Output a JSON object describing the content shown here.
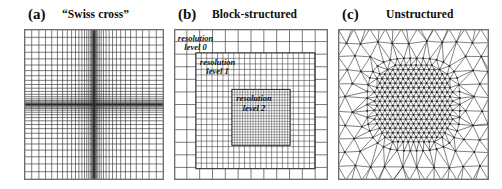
{
  "figure": {
    "caption_kind": "mesh-refinement-comparison",
    "background": "#ffffff",
    "line_color": "#2b2b2b",
    "frame_color": "#6e6e6e",
    "width": 502,
    "height": 189
  },
  "panels": [
    {
      "tag": "(a)",
      "title": "“Swiss cross”",
      "mesh_type": "swiss-cross",
      "tag_x": 28,
      "title_x": 62,
      "box_x": 24,
      "box_y": 29,
      "box_w": 140,
      "box_h": 151,
      "grid": {
        "n_lines": 41,
        "center": 0.5,
        "concentration": 2.45,
        "edge_fraction": 0.055
      }
    },
    {
      "tag": "(b)",
      "title": "Block-structured",
      "mesh_type": "block-structured",
      "tag_x": 178,
      "title_x": 212,
      "box_x": 174,
      "box_y": 29,
      "box_w": 154,
      "box_h": 151,
      "blocks": [
        {
          "level": 0,
          "x0": 0.0,
          "y0": 0.0,
          "x1": 1.0,
          "y1": 1.0,
          "div": 12
        },
        {
          "level": 1,
          "x0": 0.142,
          "y0": 0.158,
          "x1": 0.915,
          "y1": 0.925,
          "div": 22
        },
        {
          "level": 2,
          "x0": 0.376,
          "y0": 0.4,
          "x1": 0.754,
          "y1": 0.77,
          "div": 22
        }
      ],
      "labels": [
        {
          "text_line1": "resolution",
          "text_line2": "level 0",
          "x": 0.012,
          "y": 0.018
        },
        {
          "text_line1": "resolution",
          "text_line2": "level 1",
          "x": 0.155,
          "y": 0.178
        },
        {
          "text_line1": "resolution",
          "text_line2": "level 2",
          "x": 0.392,
          "y": 0.42
        }
      ]
    },
    {
      "tag": "(c)",
      "title": "Unstructured",
      "mesh_type": "unstructured",
      "tag_x": 342,
      "title_x": 386,
      "box_x": 338,
      "box_y": 29,
      "box_w": 151,
      "box_h": 151,
      "triangulation": {
        "coarse_spacing": 0.105,
        "fine_spacing": 0.0345,
        "core_radius": 0.268,
        "transition_radius": 0.345,
        "node_dot_radius": 1.05,
        "jitter": 0.22
      }
    }
  ]
}
